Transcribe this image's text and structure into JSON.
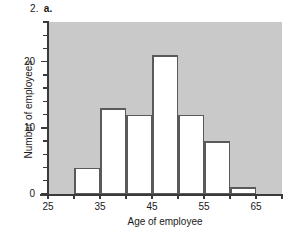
{
  "figure": {
    "number_label": "2.",
    "part_label": "a."
  },
  "chart_data": {
    "type": "bar",
    "title": "",
    "subtitle": "",
    "xlabel": "Age of employee",
    "ylabel": "Number of employees",
    "xlim": [
      25,
      70
    ],
    "ylim": [
      0,
      26
    ],
    "grid": false,
    "legend": null,
    "bin_width": 5,
    "bin_edges": [
      25,
      30,
      35,
      40,
      45,
      50,
      55,
      60,
      65,
      70
    ],
    "categories": [
      "25-30",
      "30-35",
      "35-40",
      "40-45",
      "45-50",
      "50-55",
      "55-60",
      "60-65",
      "65-70"
    ],
    "values": [
      0,
      4,
      13,
      12,
      21,
      12,
      8,
      1,
      0
    ],
    "bars": [
      {
        "x0": 30,
        "x1": 35,
        "value": 4
      },
      {
        "x0": 35,
        "x1": 40,
        "value": 13
      },
      {
        "x0": 40,
        "x1": 45,
        "value": 12
      },
      {
        "x0": 45,
        "x1": 50,
        "value": 21
      },
      {
        "x0": 50,
        "x1": 55,
        "value": 12
      },
      {
        "x0": 55,
        "x1": 60,
        "value": 8
      },
      {
        "x0": 60,
        "x1": 65,
        "value": 1
      }
    ],
    "x_ticks": [
      25,
      30,
      35,
      40,
      45,
      50,
      55,
      60,
      65,
      70
    ],
    "x_tick_labels": [
      {
        "value": 25,
        "label": "25"
      },
      {
        "value": 35,
        "label": "35"
      },
      {
        "value": 45,
        "label": "45"
      },
      {
        "value": 55,
        "label": "55"
      },
      {
        "value": 65,
        "label": "65"
      }
    ],
    "y_ticks_major": [
      0,
      10,
      20
    ],
    "y_tick_labels": [
      {
        "value": 0,
        "label": "0"
      },
      {
        "value": 10,
        "label": "10"
      },
      {
        "value": 20,
        "label": "20"
      }
    ],
    "y_ticks_minor": [
      2,
      4,
      6,
      8,
      12,
      14,
      16,
      18,
      22,
      24,
      26
    ],
    "colors": {
      "plot_background": "#c9c9c9",
      "bar_fill": "#ffffff",
      "bar_edge": "#5a5a5a",
      "axis": "#3a3a3a",
      "text": "#1a1a1a",
      "page_background": "#ffffff"
    }
  }
}
